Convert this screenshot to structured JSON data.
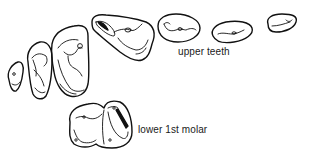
{
  "diagram": {
    "type": "scientific-illustration",
    "labels": {
      "upper_teeth": "upper teeth",
      "lower_first_molar": "lower 1st molar"
    },
    "elements": [
      {
        "id": "upper-tooth-1",
        "group": "upper teeth",
        "shape": "small triangular crown"
      },
      {
        "id": "upper-tooth-2",
        "group": "upper teeth",
        "shape": "triangular crown"
      },
      {
        "id": "upper-tooth-3",
        "group": "upper teeth",
        "shape": "large triangular molar crown"
      },
      {
        "id": "upper-tooth-4",
        "group": "upper teeth",
        "shape": "wide triangular molar crown"
      },
      {
        "id": "upper-tooth-5",
        "group": "upper teeth",
        "shape": "oval crown"
      },
      {
        "id": "upper-tooth-6",
        "group": "upper teeth",
        "shape": "oval crown"
      },
      {
        "id": "upper-tooth-7",
        "group": "upper teeth",
        "shape": "small oval crown"
      },
      {
        "id": "lower-first-molar",
        "group": "lower 1st molar",
        "shape": "two-lobed crown"
      }
    ],
    "colors": {
      "stroke": "#111111",
      "background": "#ffffff",
      "text": "#1a1a1a"
    }
  }
}
